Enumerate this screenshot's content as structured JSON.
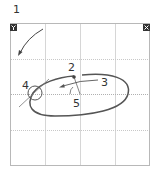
{
  "diagram": {
    "callouts": [
      {
        "id": "1",
        "label": "1",
        "x": 13,
        "y": 13
      },
      {
        "id": "2",
        "label": "2",
        "x": 71,
        "y": 69
      },
      {
        "id": "3",
        "label": "3",
        "x": 101,
        "y": 83
      },
      {
        "id": "4",
        "label": "4",
        "x": 21,
        "y": 93
      },
      {
        "id": "5",
        "label": "5",
        "x": 73,
        "y": 104
      }
    ],
    "corner_badges": {
      "left": {
        "label": "Y",
        "color": "#333333"
      },
      "right": {
        "label": "X",
        "color": "#333333"
      }
    },
    "colors": {
      "frame": "#b8b8b8",
      "grid": "#d0d0d0",
      "path": "#555555",
      "text": "#333333"
    }
  }
}
